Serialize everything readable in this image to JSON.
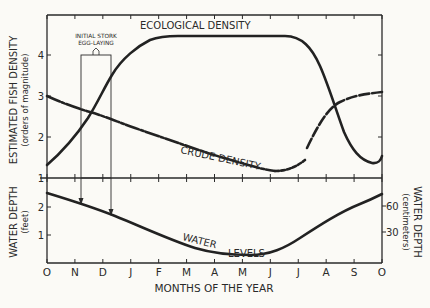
{
  "chart_data": [
    {
      "type": "line",
      "panel": "upper",
      "title": "",
      "xlabel": "MONTHS OF THE YEAR",
      "ylabel": "ESTIMATED FISH DENSITY",
      "ylabel_sub": "(orders of magnitude)",
      "categories": [
        "O",
        "N",
        "D",
        "J",
        "F",
        "M",
        "A",
        "M",
        "J",
        "J",
        "A",
        "S",
        "O"
      ],
      "ylim": [
        1,
        4.5
      ],
      "yticks": [
        1,
        2,
        3,
        4
      ],
      "grid": false,
      "series": [
        {
          "name": "ECOLOGICAL DENSITY",
          "style": "solid (dashed segment Jul–Oct)",
          "values": [
            1.3,
            2.2,
            3.3,
            3.9,
            4.1,
            4.1,
            4.1,
            4.1,
            4.0,
            3.0,
            2.0,
            2.6,
            3.1
          ]
        },
        {
          "name": "CRUDE DENSITY",
          "style": "solid with dashed segments",
          "values": [
            3.0,
            2.7,
            2.4,
            2.1,
            1.8,
            1.5,
            1.3,
            1.2,
            1.25,
            1.5,
            1.9,
            1.3,
            1.45
          ]
        }
      ],
      "annotations": [
        {
          "text": "INITIAL STORK EGG-LAYING",
          "x_range": [
            "N",
            "D"
          ],
          "shape": "box with arrows down to water level curve"
        }
      ]
    },
    {
      "type": "line",
      "panel": "lower",
      "xlabel": "MONTHS OF THE YEAR",
      "ylabel": "WATER DEPTH",
      "ylabel_sub": "(feet)",
      "ylabel_right": "WATER DEPTH",
      "ylabel_right_sub": "(centimeters)",
      "categories": [
        "O",
        "N",
        "D",
        "J",
        "F",
        "M",
        "A",
        "M",
        "J",
        "J",
        "A",
        "S",
        "O"
      ],
      "ylim": [
        0,
        2.8
      ],
      "yticks": [
        1,
        2
      ],
      "yticks_right": [
        30,
        60
      ],
      "series": [
        {
          "name": "WATER LEVELS",
          "values": [
            2.5,
            2.15,
            1.7,
            1.3,
            0.95,
            0.65,
            0.45,
            0.35,
            0.5,
            0.9,
            1.5,
            2.1,
            2.5
          ]
        }
      ]
    }
  ],
  "labels": {
    "ecological": "ECOLOGICAL DENSITY",
    "crude": "CRUDE DENSITY",
    "water": "WATER",
    "levels": "LEVELS",
    "stork_line1": "INITIAL STORK",
    "stork_line2": "EGG-LAYING",
    "ylabel_upper": "ESTIMATED FISH DENSITY",
    "ylabel_upper_sub": "(orders of magnitude)",
    "ylabel_lower": "WATER DEPTH",
    "ylabel_lower_sub": "(feet)",
    "ylabel_right": "WATER DEPTH",
    "ylabel_right_sub": "(centimeters)",
    "xlabel": "MONTHS OF THE YEAR",
    "months": [
      "O",
      "N",
      "D",
      "J",
      "F",
      "M",
      "A",
      "M",
      "J",
      "J",
      "A",
      "S",
      "O"
    ],
    "yticks_upper": [
      "4",
      "3",
      "2",
      "1"
    ],
    "yticks_lower": [
      "2",
      "1"
    ],
    "yticks_right": [
      "60",
      "30"
    ]
  }
}
